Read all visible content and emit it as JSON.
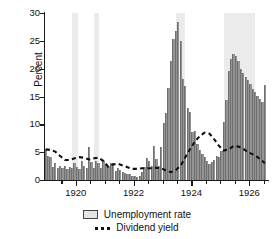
{
  "chart_data": {
    "type": "bar",
    "title": "",
    "xlabel": "",
    "ylabel": "Percent",
    "ylim": [
      0,
      30
    ],
    "xlim": [
      1918.9,
      1926.65
    ],
    "yticks": [
      0,
      5,
      10,
      15,
      20,
      25,
      30
    ],
    "xticks_major": [
      1920,
      1922,
      1924,
      1926
    ],
    "xticks_minor": [
      1919.5,
      1920.5,
      1921,
      1921.5,
      1922.5,
      1923,
      1923.5,
      1924.5,
      1925,
      1925.5,
      1926.5
    ],
    "grid": false,
    "legend_position": "below",
    "legend": [
      {
        "label": "Unemployment rate",
        "marker": "swatch",
        "color": "#949494"
      },
      {
        "label": "Dividend yield",
        "marker": "dashed-line",
        "color": "#111111"
      }
    ],
    "series": [
      {
        "name": "Unemployment rate",
        "type": "bar",
        "color": "#949494",
        "x": [
          1918.96,
          1919.04,
          1919.13,
          1919.21,
          1919.29,
          1919.38,
          1919.46,
          1919.54,
          1919.63,
          1919.71,
          1919.79,
          1919.88,
          1919.96,
          1920.04,
          1920.13,
          1920.21,
          1920.29,
          1920.38,
          1920.46,
          1920.54,
          1920.63,
          1920.71,
          1920.79,
          1920.88,
          1920.96,
          1921.04,
          1921.13,
          1921.21,
          1921.29,
          1921.38,
          1921.46,
          1921.54,
          1921.63,
          1921.71,
          1921.79,
          1921.88,
          1921.96,
          1922.04,
          1922.13,
          1922.21,
          1922.29,
          1922.38,
          1922.46,
          1922.54,
          1922.63,
          1922.71,
          1922.79,
          1922.88,
          1922.96,
          1923.04,
          1923.13,
          1923.21,
          1923.29,
          1923.38,
          1923.46,
          1923.54,
          1923.63,
          1923.71,
          1923.79,
          1923.88,
          1923.96,
          1924.04,
          1924.13,
          1924.21,
          1924.29,
          1924.38,
          1924.46,
          1924.54,
          1924.63,
          1924.71,
          1924.79,
          1924.88,
          1924.96,
          1925.04,
          1925.13,
          1925.21,
          1925.29,
          1925.38,
          1925.46,
          1925.54,
          1925.63,
          1925.71,
          1925.79,
          1925.88,
          1925.96,
          1926.04,
          1926.13,
          1926.21,
          1926.29,
          1926.38,
          1926.46,
          1926.54
        ],
        "values": [
          5.6,
          4.3,
          4.1,
          2.4,
          3.1,
          2.1,
          2.6,
          2.2,
          2.5,
          1.9,
          2.4,
          2.2,
          3.0,
          2.3,
          2.0,
          3.4,
          2.6,
          2.1,
          5.9,
          3.2,
          2.2,
          3.4,
          3.0,
          2.1,
          3.4,
          2.9,
          2.5,
          3.1,
          3.0,
          1.6,
          2.2,
          1.8,
          1.5,
          1.2,
          1.0,
          1.0,
          0.8,
          0.7,
          0.6,
          0.7,
          1.4,
          2.4,
          4.0,
          3.5,
          2.6,
          6.1,
          3.7,
          2.6,
          5.9,
          10.2,
          12.0,
          16.6,
          21.3,
          25.4,
          26.8,
          28.3,
          25.0,
          18.2,
          16.9,
          13.0,
          12.3,
          8.7,
          8.8,
          6.4,
          5.4,
          4.6,
          4.1,
          3.5,
          2.9,
          3.2,
          3.6,
          4.3,
          4.2,
          5.2,
          10.5,
          14.3,
          19.5,
          21.8,
          22.6,
          22.2,
          21.3,
          19.9,
          19.2,
          18.5,
          17.9,
          17.2,
          16.4,
          15.8,
          15.1,
          14.5,
          14.0,
          17.0
        ]
      },
      {
        "name": "Dividend yield",
        "type": "line",
        "style": "dashed",
        "color": "#111111",
        "x": [
          1918.96,
          1919.12,
          1919.29,
          1919.46,
          1919.63,
          1919.79,
          1919.96,
          1920.12,
          1920.29,
          1920.46,
          1920.63,
          1920.79,
          1920.96,
          1921.12,
          1921.29,
          1921.46,
          1921.63,
          1921.79,
          1921.96,
          1922.12,
          1922.29,
          1922.46,
          1922.63,
          1922.79,
          1922.96,
          1923.12,
          1923.29,
          1923.46,
          1923.63,
          1923.79,
          1923.96,
          1924.12,
          1924.29,
          1924.46,
          1924.63,
          1924.79,
          1924.96,
          1925.12,
          1925.29,
          1925.46,
          1925.63,
          1925.79,
          1925.96,
          1926.12,
          1926.29,
          1926.46,
          1926.54
        ],
        "values": [
          5.5,
          5.4,
          5.1,
          4.3,
          3.6,
          3.6,
          3.9,
          4.1,
          4.0,
          3.7,
          3.9,
          4.0,
          3.4,
          2.4,
          2.8,
          2.9,
          2.6,
          2.3,
          2.0,
          2.0,
          2.1,
          2.1,
          2.1,
          2.2,
          2.1,
          1.7,
          1.4,
          1.8,
          2.6,
          4.1,
          5.6,
          6.9,
          7.9,
          8.5,
          8.3,
          7.3,
          6.1,
          5.3,
          5.5,
          6.1,
          6.0,
          5.6,
          5.0,
          4.6,
          4.1,
          3.4,
          3.0
        ]
      }
    ],
    "shaded_bands": [
      {
        "name": "recession-band-1",
        "start": 1919.88,
        "end": 1920.06,
        "color": "#ebebeb"
      },
      {
        "name": "recession-band-2",
        "start": 1920.62,
        "end": 1920.8,
        "color": "#ebebeb"
      },
      {
        "name": "recession-band-3",
        "start": 1923.45,
        "end": 1923.78,
        "color": "#ebebeb"
      },
      {
        "name": "recession-band-4",
        "start": 1925.12,
        "end": 1926.2,
        "color": "#ebebeb"
      }
    ]
  }
}
